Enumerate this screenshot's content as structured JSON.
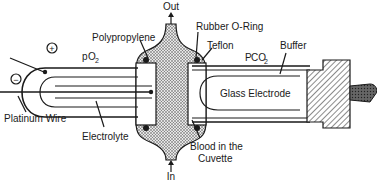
{
  "diagram": {
    "labels": {
      "out": "Out",
      "in": "In",
      "polypropylene": "Polypropylene",
      "rubber_o_ring": "Rubber O-Ring",
      "teflon": "Teflon",
      "buffer": "Buffer",
      "po2_main": "p",
      "po2_sub": "O",
      "po2_sub2": "2",
      "pco2_main": "P",
      "pco2_sub": "CO",
      "pco2_sub2": "2",
      "glass_electrode": "Glass Electrode",
      "platinum_wire": "Platinum Wire",
      "electrolyte": "Electrolyte",
      "blood_line1": "Blood in the",
      "blood_line2": "Cuvette",
      "plus": "+",
      "minus": "−"
    },
    "icons": {
      "out_arrow": "arrow-up",
      "in_arrow": "arrow-up"
    },
    "colors": {
      "ink": "#1a1a1a",
      "blood_fill": "#9a9a9a",
      "background": "#ffffff"
    }
  }
}
